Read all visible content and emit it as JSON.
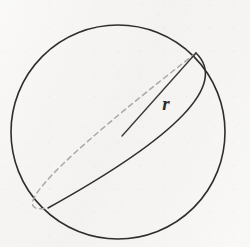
{
  "figure": {
    "kind": "geometry-diagram",
    "canvas": {
      "width": 250,
      "height": 247
    },
    "background_color": "#f5f4f2"
  },
  "labels": {
    "radius": "r"
  },
  "colors": {
    "outline": "#2e2e30",
    "great_circle_solid": "#2e2e30",
    "great_circle_hidden": "#a9a9ad",
    "radius_line": "#3a3a3c",
    "label_text": "#2b2b2d",
    "background": "#f5f4f2"
  },
  "geometry": {
    "sphere": {
      "center_x": 118,
      "center_y": 132,
      "radius": 107,
      "stroke_width": 1.6
    },
    "great_circle": {
      "endpoint_top_right_x": 196,
      "endpoint_top_right_y": 53,
      "endpoint_bottom_left_x": 48,
      "endpoint_bottom_left_y": 208,
      "visible_arc_bulge_x": 183,
      "visible_arc_bulge_y": 115,
      "hidden_arc_bulge_x": 52,
      "hidden_arc_bulge_y": 175,
      "stroke_width": 1.5,
      "dash_pattern": "5 4"
    },
    "radius_line": {
      "start_x": 122,
      "start_y": 136,
      "end_x": 196,
      "end_y": 53,
      "stroke_width": 1.4
    },
    "radius_label_position": {
      "x": 166,
      "y": 110
    }
  }
}
